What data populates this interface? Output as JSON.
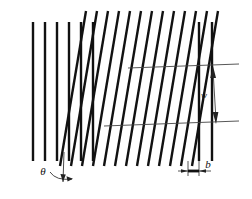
{
  "figure": {
    "background_color": "#ffffff",
    "line_color": "#111111",
    "dimension_color": "#333333",
    "width": 252,
    "height": 199,
    "labels": {
      "angle_label": "θ",
      "pitch_label": "w",
      "thickness_label": "b"
    },
    "groups": {
      "left_vertical": {
        "name": "left vertical fins",
        "count": 6,
        "x_positions": [
          33,
          45,
          57,
          69,
          81,
          93
        ],
        "y_top": 22,
        "y_bottom": 161
      },
      "slanted": {
        "name": "inclined fins",
        "count": 13,
        "x_top_positions": [
          86,
          97,
          108,
          119,
          130,
          141,
          152,
          163,
          174,
          185,
          196,
          207,
          218
        ],
        "y_top": 11,
        "y_bottom": 166,
        "x_shift": -26
      },
      "right_vertical": {
        "name": "right vertical fins",
        "count": 2,
        "x_positions": [
          199,
          212
        ],
        "y_top": 22,
        "y_bottom": 161
      }
    },
    "dimensions": {
      "pitch": {
        "label": "w",
        "orientation": "vertical",
        "x": 215,
        "y_start": 66,
        "y_end": 124,
        "ext_left_x": 128,
        "ext_right_x": 238
      },
      "thickness": {
        "label": "b",
        "orientation": "horizontal",
        "y": 171,
        "x_start": 188,
        "x_end": 199
      },
      "angle": {
        "label": "θ",
        "vertex_x": 63,
        "vertex_y": 176,
        "arc_radius": 14
      }
    }
  }
}
